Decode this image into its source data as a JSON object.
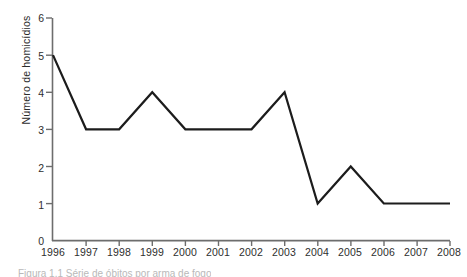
{
  "figure": {
    "caption_visible_fragment": "Figura 1.1  Série de óbitos por arma de fogo"
  },
  "chart_data": {
    "type": "line",
    "title": "",
    "subtitle": "",
    "xlabel": "",
    "ylabel": "Número de homicídios",
    "categories": [
      "1996",
      "1997",
      "1998",
      "1999",
      "2000",
      "2001",
      "2002",
      "2003",
      "2004",
      "2005",
      "2006",
      "2007",
      "2008"
    ],
    "values": [
      5,
      3,
      3,
      4,
      3,
      3,
      3,
      4,
      1,
      2,
      1,
      1,
      1
    ],
    "series": [
      {
        "name": "Número de homicídios",
        "values": [
          5,
          3,
          3,
          4,
          3,
          3,
          3,
          4,
          1,
          2,
          1,
          1,
          1
        ]
      }
    ],
    "ylim": [
      0,
      6
    ],
    "yticks": [
      "0",
      "1",
      "2",
      "3",
      "4",
      "5",
      "6"
    ],
    "ytick_values": [
      0,
      1,
      2,
      3,
      4,
      5,
      6
    ],
    "xticks": [
      "1996",
      "1997",
      "1998",
      "1999",
      "2000",
      "2001",
      "2002",
      "2003",
      "2004",
      "2005",
      "2006",
      "2007",
      "2008"
    ],
    "grid": false,
    "legend": false,
    "legend_position": "none",
    "line_color": "#1c1c1c",
    "background_color": "#ffffff",
    "markers": false,
    "annotations": []
  }
}
